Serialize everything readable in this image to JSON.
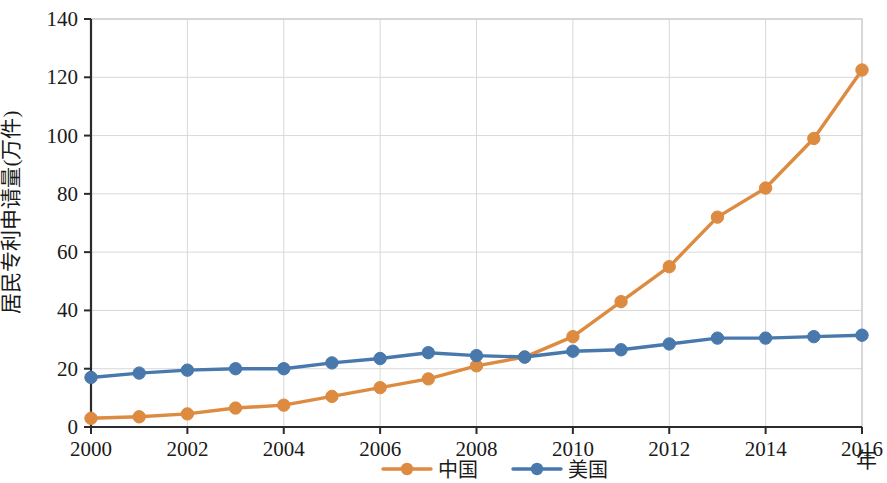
{
  "chart_data": {
    "type": "line",
    "title": "",
    "xlabel": "年",
    "ylabel": "居民专利申请量(万件)",
    "x": [
      2000,
      2001,
      2002,
      2003,
      2004,
      2005,
      2006,
      2007,
      2008,
      2009,
      2010,
      2011,
      2012,
      2013,
      2014,
      2015,
      2016
    ],
    "xlim": [
      2000,
      2016
    ],
    "ylim": [
      0,
      140
    ],
    "x_tick_labels": [
      "2000",
      "2002",
      "2004",
      "2006",
      "2008",
      "2010",
      "2012",
      "2014",
      "2016"
    ],
    "x_ticks": [
      2000,
      2002,
      2004,
      2006,
      2008,
      2010,
      2012,
      2014,
      2016
    ],
    "y_tick_labels": [
      "0",
      "20",
      "40",
      "60",
      "80",
      "100",
      "120",
      "140"
    ],
    "y_ticks": [
      0,
      20,
      40,
      60,
      80,
      100,
      120,
      140
    ],
    "grid": true,
    "legend_position": "bottom",
    "series": [
      {
        "name": "中国",
        "color": "#DD8B40",
        "marker": "circle",
        "values": [
          3,
          3.5,
          4.5,
          6.5,
          7.5,
          10.5,
          13.5,
          16.5,
          21,
          24,
          31,
          43,
          55,
          72,
          82,
          99,
          122.5
        ]
      },
      {
        "name": "美国",
        "color": "#4878AC",
        "marker": "circle",
        "values": [
          17,
          18.5,
          19.5,
          20,
          20,
          22,
          23.5,
          25.5,
          24.5,
          24,
          26,
          26.5,
          28.5,
          30.5,
          30.5,
          31,
          31.5
        ]
      }
    ]
  },
  "legend": {
    "items": [
      {
        "label": "中国",
        "color": "#DD8B40"
      },
      {
        "label": "美国",
        "color": "#4878AC"
      }
    ]
  },
  "axes": {
    "y_title": "居民专利申请量(万件)",
    "x_title": "年"
  }
}
